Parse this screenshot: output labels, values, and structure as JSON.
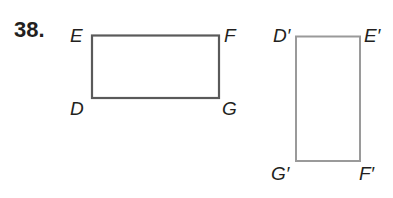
{
  "problem": {
    "number": "38."
  },
  "figures": {
    "original": {
      "name": "rectangle DEFG",
      "stroke_color": "#5a5a5a",
      "vertices": {
        "E": "E",
        "F": "F",
        "D": "D",
        "G": "G"
      }
    },
    "image": {
      "name": "rectangle D'E'F'G'",
      "stroke_color": "#9a9a9a",
      "vertices": {
        "D_prime": "D′",
        "E_prime": "E′",
        "G_prime": "G′",
        "F_prime": "F′"
      }
    }
  }
}
